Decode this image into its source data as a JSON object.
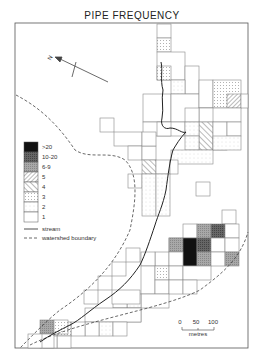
{
  "title": "PIPE FREQUENCY",
  "north_label": "N",
  "legend": {
    "classes": [
      {
        "label": ">20",
        "pattern": "solid-black"
      },
      {
        "label": "10-20",
        "pattern": "dark-grey"
      },
      {
        "label": "6-9",
        "pattern": "mid-grey"
      },
      {
        "label": "5",
        "pattern": "hatch-dense"
      },
      {
        "label": "4",
        "pattern": "hatch-wide"
      },
      {
        "label": "3",
        "pattern": "dots"
      },
      {
        "label": "2",
        "pattern": "light-dots"
      },
      {
        "label": "1",
        "pattern": "blank"
      }
    ],
    "stream_label": "stream",
    "boundary_label": "watershed boundary"
  },
  "scale_bar": {
    "ticks": [
      "0",
      "50",
      "100"
    ],
    "unit": "metres"
  },
  "colors": {
    "line": "#555555",
    "black": "#111111",
    "dark_grey": "#555555",
    "mid_grey": "#9a9a9a",
    "dots": "#bbbbbb"
  }
}
